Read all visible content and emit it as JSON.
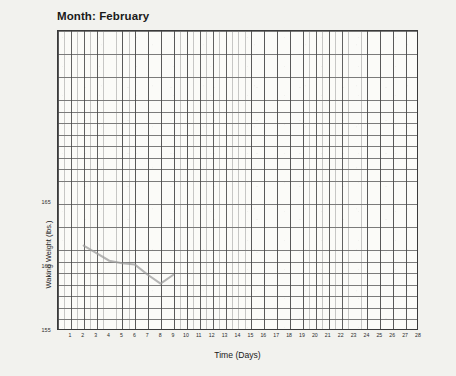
{
  "chart_data": {
    "type": "line",
    "title": "Month: February",
    "xlabel": "Time (Days)",
    "ylabel": "Waking Weight (lbs.)",
    "grid": true,
    "legend": "none",
    "xlim": [
      0,
      28
    ],
    "ylim": [
      155,
      178.5
    ],
    "x_ticks": [
      1,
      2,
      3,
      4,
      5,
      6,
      7,
      8,
      9,
      10,
      11,
      12,
      13,
      14,
      15,
      16,
      17,
      18,
      19,
      20,
      21,
      22,
      23,
      24,
      25,
      26,
      27,
      28
    ],
    "x_tick_labels": [
      "1",
      "2",
      "3",
      "4",
      "5",
      "6",
      "7",
      "8",
      "9",
      "10",
      "11",
      "12",
      "13",
      "14",
      "15",
      "16",
      "17",
      "18",
      "19",
      "20",
      "21",
      "22",
      "23",
      "24",
      "25",
      "26",
      "27",
      "28"
    ],
    "y_ticks": [
      155,
      160,
      165
    ],
    "y_tick_labels": [
      "155",
      "160",
      "165"
    ],
    "series": [
      {
        "name": "Waking Weight",
        "color": "#9a9a9a",
        "x": [
          2,
          3,
          4,
          5,
          6,
          7,
          8,
          9
        ],
        "values": [
          161.6,
          161.0,
          160.4,
          160.2,
          160.1,
          159.3,
          158.6,
          159.3
        ]
      }
    ]
  },
  "chart": {
    "title": "Month: February",
    "xaxis_title": "Time (Days)",
    "yaxis_title": "Waking Weight (lbs.)"
  }
}
